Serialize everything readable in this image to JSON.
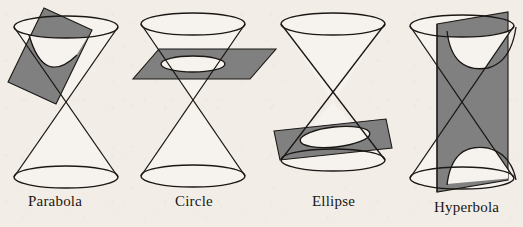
{
  "figure": {
    "background_color": "#f2eee7",
    "plane_color": "#808080",
    "plane_stroke": "#1a1714",
    "cone_stroke": "#1a1714",
    "label_color": "#1a1714",
    "panel_count": 4
  },
  "panels": [
    {
      "id": "parabola",
      "label": "Parabola",
      "label_x": 28,
      "label_y": 193,
      "cutting_plane": "oblique-tilted-rectangle",
      "plane_angle_deg": -28,
      "section_curve": "parabola",
      "cone_center_x": 66,
      "description": "Double cone cut by a plane parallel to one generating line"
    },
    {
      "id": "circle",
      "label": "Circle",
      "label_x": 175,
      "label_y": 193,
      "cutting_plane": "horizontal-parallelogram",
      "plane_angle_deg": 0,
      "section_curve": "circle",
      "cone_center_x": 193,
      "description": "Double cone cut by a plane perpendicular to the axis"
    },
    {
      "id": "ellipse",
      "label": "Ellipse",
      "label_x": 312,
      "label_y": 193,
      "cutting_plane": "oblique-parallelogram",
      "plane_angle_deg": 12,
      "section_curve": "ellipse",
      "cone_center_x": 333,
      "description": "Double cone cut by an oblique plane crossing one nappe"
    },
    {
      "id": "hyperbola",
      "label": "Hyperbola",
      "label_x": 434,
      "label_y": 199,
      "cutting_plane": "vertical-plane",
      "plane_angle_deg": 90,
      "section_curve": "hyperbola",
      "cone_center_x": 462,
      "description": "Double cone cut by a plane parallel to the axis, meeting both nappes"
    }
  ]
}
